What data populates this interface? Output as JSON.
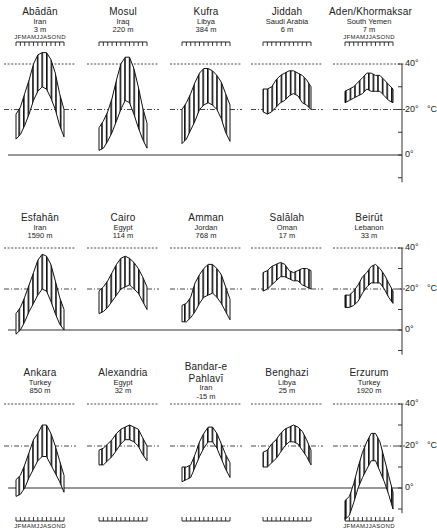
{
  "chart_data": {
    "type": "area",
    "ylabel": "°C",
    "y_ticks": [
      "0°",
      "20°",
      "40°"
    ],
    "ylim": [
      -10,
      45
    ],
    "month_labels": "JFMAMJJASOND",
    "reference_lines": [
      {
        "value": 40,
        "style": "dashed"
      },
      {
        "value": 20,
        "style": "dash-dot"
      }
    ],
    "stations": [
      {
        "name": "Abādān",
        "country": "Iran",
        "elevation": "3 m",
        "row": 0,
        "col": 0,
        "max": [
          18,
          21,
          27,
          33,
          40,
          44,
          45,
          45,
          42,
          36,
          27,
          20
        ],
        "min": [
          7,
          9,
          13,
          18,
          24,
          28,
          30,
          29,
          25,
          20,
          13,
          8
        ]
      },
      {
        "name": "Mosul",
        "country": "Iraq",
        "elevation": "220 m",
        "row": 0,
        "col": 1,
        "max": [
          12,
          15,
          19,
          25,
          33,
          40,
          43,
          43,
          38,
          30,
          21,
          14
        ],
        "min": [
          2,
          3,
          6,
          10,
          15,
          20,
          24,
          23,
          18,
          12,
          7,
          3
        ]
      },
      {
        "name": "Kufra",
        "country": "Libya",
        "elevation": "384 m",
        "row": 0,
        "col": 2,
        "max": [
          20,
          23,
          27,
          32,
          36,
          38,
          38,
          37,
          35,
          32,
          27,
          22
        ],
        "min": [
          5,
          7,
          11,
          15,
          20,
          22,
          23,
          22,
          20,
          16,
          10,
          6
        ]
      },
      {
        "name": "Jiddah",
        "country": "Saudi Arabia",
        "elevation": "6 m",
        "row": 0,
        "col": 3,
        "max": [
          29,
          29,
          30,
          33,
          35,
          36,
          37,
          37,
          36,
          35,
          33,
          30
        ],
        "min": [
          19,
          18,
          19,
          21,
          23,
          24,
          26,
          27,
          26,
          23,
          22,
          20
        ]
      },
      {
        "name": "Aden/Khormaksar",
        "country": "South Yemen",
        "elevation": "7 m",
        "row": 0,
        "col": 4,
        "max": [
          28,
          29,
          30,
          32,
          34,
          36,
          36,
          35,
          35,
          33,
          31,
          29
        ],
        "min": [
          23,
          24,
          25,
          26,
          27,
          29,
          28,
          28,
          28,
          26,
          24,
          23
        ]
      },
      {
        "name": "Esfahān",
        "country": "Iran",
        "elevation": "1590 m",
        "row": 1,
        "col": 0,
        "max": [
          8,
          11,
          16,
          22,
          28,
          34,
          37,
          36,
          32,
          24,
          16,
          10
        ],
        "min": [
          -2,
          0,
          4,
          9,
          13,
          17,
          20,
          19,
          14,
          8,
          3,
          0
        ]
      },
      {
        "name": "Cairo",
        "country": "Egypt",
        "elevation": "114 m",
        "row": 1,
        "col": 1,
        "max": [
          19,
          21,
          24,
          28,
          32,
          35,
          36,
          35,
          33,
          30,
          26,
          21
        ],
        "min": [
          8,
          9,
          11,
          14,
          17,
          20,
          21,
          22,
          20,
          18,
          14,
          10
        ]
      },
      {
        "name": "Amman",
        "country": "Jordan",
        "elevation": "768 m",
        "row": 1,
        "col": 2,
        "max": [
          12,
          13,
          16,
          23,
          27,
          30,
          32,
          32,
          30,
          27,
          21,
          15
        ],
        "min": [
          4,
          4,
          6,
          9,
          13,
          16,
          17,
          18,
          16,
          13,
          9,
          5
        ]
      },
      {
        "name": "Salālah",
        "country": "Oman",
        "elevation": "17 m",
        "row": 1,
        "col": 3,
        "max": [
          28,
          29,
          31,
          32,
          33,
          32,
          29,
          28,
          29,
          30,
          30,
          29
        ],
        "min": [
          19,
          20,
          22,
          24,
          26,
          26,
          25,
          24,
          24,
          22,
          21,
          20
        ]
      },
      {
        "name": "Beirūt",
        "country": "Lebanon",
        "elevation": "33 m",
        "row": 1,
        "col": 4,
        "max": [
          17,
          17,
          19,
          22,
          26,
          28,
          31,
          32,
          30,
          27,
          23,
          19
        ],
        "min": [
          11,
          11,
          12,
          14,
          18,
          21,
          23,
          23,
          23,
          20,
          16,
          13
        ]
      },
      {
        "name": "Ankara",
        "country": "Turkey",
        "elevation": "850 m",
        "row": 2,
        "col": 0,
        "max": [
          4,
          6,
          11,
          17,
          23,
          26,
          30,
          30,
          26,
          20,
          13,
          6
        ],
        "min": [
          -4,
          -3,
          0,
          5,
          9,
          13,
          15,
          15,
          11,
          7,
          3,
          -2
        ]
      },
      {
        "name": "Alexandria",
        "country": "Egypt",
        "elevation": "32 m",
        "row": 2,
        "col": 1,
        "max": [
          18,
          19,
          21,
          23,
          26,
          28,
          29,
          30,
          29,
          28,
          24,
          20
        ],
        "min": [
          11,
          11,
          13,
          15,
          18,
          21,
          23,
          23,
          22,
          20,
          16,
          13
        ]
      },
      {
        "name": "Bandar-e Pahlavī",
        "country": "Iran",
        "elevation": "-15 m",
        "row": 2,
        "col": 2,
        "max": [
          10,
          10,
          11,
          16,
          22,
          26,
          29,
          29,
          26,
          21,
          16,
          12
        ],
        "min": [
          3,
          4,
          5,
          10,
          15,
          19,
          22,
          22,
          19,
          14,
          9,
          5
        ]
      },
      {
        "name": "Benghazi",
        "country": "Libya",
        "elevation": "25 m",
        "row": 2,
        "col": 3,
        "max": [
          17,
          18,
          21,
          23,
          26,
          28,
          29,
          30,
          29,
          27,
          23,
          18
        ],
        "min": [
          10,
          10,
          12,
          14,
          17,
          20,
          22,
          22,
          21,
          18,
          15,
          11
        ]
      },
      {
        "name": "Erzurum",
        "country": "Turkey",
        "elevation": "1920 m",
        "row": 2,
        "col": 4,
        "max": [
          -6,
          -4,
          2,
          10,
          17,
          22,
          26,
          26,
          22,
          14,
          6,
          -2
        ],
        "min": [
          -15,
          -13,
          -7,
          0,
          5,
          9,
          13,
          13,
          8,
          3,
          -3,
          -10
        ]
      }
    ]
  }
}
